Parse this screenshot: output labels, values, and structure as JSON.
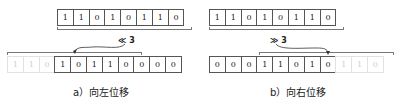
{
  "left_shift": {
    "original_bits": [
      "1",
      "1",
      "0",
      "1",
      "0",
      "1",
      "1",
      "0"
    ],
    "shifted_out_bits": [
      "1",
      "1",
      "0"
    ],
    "result_bits": [
      "1",
      "0",
      "1",
      "1",
      "0",
      "0",
      "0",
      "0"
    ],
    "operator_label": "≪ 3",
    "caption": "a）向左位移"
  },
  "right_shift": {
    "original_bits": [
      "1",
      "1",
      "0",
      "1",
      "0",
      "1",
      "1",
      "0"
    ],
    "result_bits": [
      "0",
      "0",
      "0",
      "1",
      "1",
      "0",
      "1",
      "0"
    ],
    "shifted_out_bits": [
      "1",
      "1",
      "0"
    ],
    "operator_label": "≫ 3",
    "caption": "b）向右位移"
  }
}
